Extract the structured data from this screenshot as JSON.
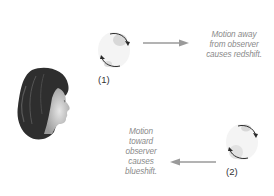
{
  "diagram": {
    "observer": {
      "icon": "observer-face-profile"
    },
    "objects": [
      {
        "id": "1",
        "label": "(1)",
        "motion": "away",
        "caption_lines": [
          "Motion away",
          "from observer",
          "causes redshift."
        ]
      },
      {
        "id": "2",
        "label": "(2)",
        "motion": "toward",
        "caption_lines": [
          "Motion",
          "toward",
          "observer",
          "causes",
          "blueshift."
        ]
      }
    ],
    "colors": {
      "arrow": "#9a9a9a",
      "caption_text": "#8a8a8a",
      "rotation_arrow": "#2a2a2a",
      "sphere_shade": "#d8d8d8"
    }
  }
}
